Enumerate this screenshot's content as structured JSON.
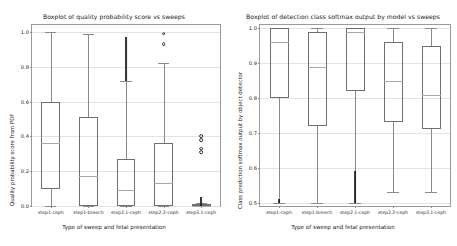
{
  "figure": {
    "width": 457,
    "height": 246,
    "background": "#ffffff",
    "frame_color": "#9a9a9a",
    "grid_color": "#e3e3e3",
    "box_edge_color": "#6f6f6f",
    "median_color": "#b0a5a5",
    "flier_color": "#2b2b2b"
  },
  "chart_data": [
    {
      "type": "box",
      "panel": "left",
      "title": "Boxplot of quality probability score vs sweeps",
      "xlabel": "Type of sweep and fetal presentation",
      "ylabel": "Quality probability score from PDF",
      "ylim": [
        0.0,
        1.04
      ],
      "yticks": [
        0.0,
        0.2,
        0.4,
        0.6,
        0.8,
        1.0
      ],
      "ytick_labels": [
        "0.0",
        "0.2",
        "0.4",
        "0.6",
        "0.8",
        "1.0"
      ],
      "grid": true,
      "legend": "none",
      "categories": [
        "step1-ceph",
        "step1-breech",
        "step2.1-ceph",
        "step2.2-ceph",
        "step3.1-ceph"
      ],
      "boxes": [
        {
          "label": "step1-ceph",
          "whisker_low": 0.0,
          "q1": 0.1,
          "median": 0.36,
          "q3": 0.6,
          "whisker_high": 1.0,
          "fliers": []
        },
        {
          "label": "step1-breech",
          "whisker_low": 0.0,
          "q1": 0.0,
          "median": 0.17,
          "q3": 0.51,
          "whisker_high": 0.99,
          "fliers": []
        },
        {
          "label": "step2.1-ceph",
          "whisker_low": 0.0,
          "q1": 0.0,
          "median": 0.09,
          "q3": 0.27,
          "whisker_high": 0.72,
          "fliers": [],
          "dense_flier_band": [
            0.72,
            0.97
          ]
        },
        {
          "label": "step2.2-ceph",
          "whisker_low": 0.0,
          "q1": 0.0,
          "median": 0.13,
          "q3": 0.36,
          "whisker_high": 0.82,
          "fliers": [
            0.99,
            0.93
          ]
        },
        {
          "label": "step3.1-ceph",
          "whisker_low": 0.0,
          "q1": 0.0,
          "median": 0.0,
          "q3": 0.01,
          "whisker_high": 0.02,
          "fliers": [
            0.4,
            0.38,
            0.33,
            0.31
          ],
          "dense_flier_band": [
            0.0,
            0.05
          ]
        }
      ]
    },
    {
      "type": "box",
      "panel": "right",
      "title": "Boxplot of detection class softmax output by model vs sweeps",
      "xlabel": "Type of sweep and fetal presentation",
      "ylabel": "Class prediction softmax output by object detector",
      "ylim": [
        0.49,
        1.01
      ],
      "yticks": [
        0.5,
        0.6,
        0.7,
        0.8,
        0.9,
        1.0
      ],
      "ytick_labels": [
        "0.5",
        "0.6",
        "0.7",
        "0.8",
        "0.9",
        "1.0"
      ],
      "grid": true,
      "legend": "none",
      "categories": [
        "step1-ceph",
        "step1-breech",
        "step2.1-ceph",
        "step2.2-ceph",
        "step3.1-ceph"
      ],
      "boxes": [
        {
          "label": "step1-ceph",
          "whisker_low": 0.5,
          "q1": 0.8,
          "median": 0.96,
          "q3": 1.0,
          "whisker_high": 1.0,
          "fliers": [],
          "dense_flier_band": [
            0.5,
            0.51
          ]
        },
        {
          "label": "step1-breech",
          "whisker_low": 0.5,
          "q1": 0.72,
          "median": 0.89,
          "q3": 0.99,
          "whisker_high": 1.0,
          "fliers": []
        },
        {
          "label": "step2.1-ceph",
          "whisker_low": 0.5,
          "q1": 0.82,
          "median": 0.99,
          "q3": 1.0,
          "whisker_high": 1.0,
          "fliers": [],
          "dense_flier_band": [
            0.5,
            0.59
          ]
        },
        {
          "label": "step2.2-ceph",
          "whisker_low": 0.53,
          "q1": 0.73,
          "median": 0.85,
          "q3": 0.96,
          "whisker_high": 1.0,
          "fliers": []
        },
        {
          "label": "step3.1-ceph",
          "whisker_low": 0.53,
          "q1": 0.71,
          "median": 0.81,
          "q3": 0.95,
          "whisker_high": 1.0,
          "fliers": []
        }
      ]
    }
  ]
}
